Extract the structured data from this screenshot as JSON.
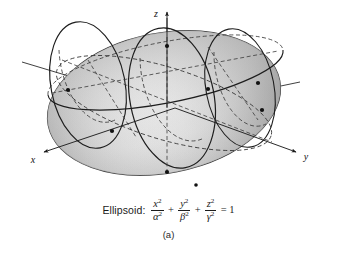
{
  "figure": {
    "kind": "3d-ellipsoid-diagram",
    "background_color": "#ffffff",
    "surface": {
      "fill_light": "#fbfbfb",
      "fill_mid": "#e4e4e4",
      "fill_dark": "#9d9d9d",
      "outline_color": "#2b2b2b"
    },
    "curve_color": "#1d1d1d",
    "dashed_color": "#3a3a3a",
    "vertex_marker_color": "#111111"
  },
  "axes": {
    "x": {
      "label": "x",
      "arrow": "down-left"
    },
    "y": {
      "label": "y",
      "arrow": "down-right"
    },
    "z": {
      "label": "z",
      "arrow": "up"
    },
    "color": "#2a2a2a"
  },
  "caption": {
    "name": "Ellipsoid:",
    "terms": [
      {
        "numerator": "x",
        "numerator_exp": "2",
        "denominator": "α",
        "denominator_exp": "2"
      },
      {
        "numerator": "y",
        "numerator_exp": "2",
        "denominator": "β",
        "denominator_exp": "2"
      },
      {
        "numerator": "z",
        "numerator_exp": "2",
        "denominator": "γ",
        "denominator_exp": "2"
      }
    ],
    "operator": "+",
    "equals": "= 1",
    "sub_label": "(a)"
  }
}
